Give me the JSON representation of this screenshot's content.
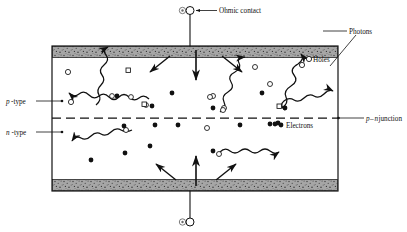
{
  "figure": {
    "labels": {
      "ohmic_contact": "Ohmic contact",
      "photons": "Photons",
      "holes": "Holes",
      "electrons": "Electrons",
      "p_type": "p-type",
      "n_type": "n-type",
      "pn_junction": "p–n junction"
    },
    "label_parts": {
      "p_italic": "p",
      "p_rest": "-type",
      "n_italic": "n",
      "n_rest": "-type",
      "junction_p": "p",
      "junction_dash": "–",
      "junction_n": "n",
      "junction_word": " junction"
    },
    "colors": {
      "ink": "#111111",
      "contact_band": "#9a9a9a",
      "contact_speckle": "#4a4a4a",
      "background": "#ffffff",
      "hole_outline": "#111111",
      "electron_fill": "#111111"
    },
    "geometry": {
      "device_x": 52,
      "device_y": 46,
      "device_w": 286,
      "device_h": 145,
      "band_h": 11,
      "junction_y": 118
    },
    "legend": {
      "hole_symbol": "open-circle",
      "electron_symbol": "filled-circle",
      "photon_symbol": "wavy-arrow",
      "current_symbol": "straight-arrow"
    },
    "carriers": {
      "holes": [
        [
          68,
          72
        ],
        [
          96,
          82
        ],
        [
          112,
          113
        ],
        [
          80,
          101
        ],
        [
          130,
          97
        ],
        [
          165,
          96
        ],
        [
          204,
          100
        ],
        [
          238,
          73
        ],
        [
          262,
          68
        ],
        [
          305,
          66
        ],
        [
          272,
          85
        ],
        [
          223,
          107
        ],
        [
          226,
          128
        ],
        [
          277,
          127
        ],
        [
          128,
          131
        ],
        [
          196,
          128
        ],
        [
          215,
          156
        ],
        [
          151,
          145
        ]
      ],
      "electrons": [
        [
          117,
          97
        ],
        [
          151,
          107
        ],
        [
          172,
          92
        ],
        [
          208,
          127
        ],
        [
          260,
          94
        ],
        [
          171,
          131
        ],
        [
          178,
          127
        ],
        [
          289,
          110
        ],
        [
          214,
          153
        ],
        [
          155,
          126
        ],
        [
          125,
          155
        ],
        [
          90,
          161
        ],
        [
          267,
          126
        ],
        [
          213,
          156
        ],
        [
          122,
          160
        ],
        [
          89,
          163
        ],
        [
          284,
          108
        ]
      ]
    },
    "photon_rays": [
      {
        "id": "photon-upper-left-exit",
        "from": [
          148,
          100
        ],
        "to": [
          38,
          84
        ],
        "dir": "left"
      },
      {
        "id": "photon-upper-mid-top",
        "from": [
          95,
          104
        ],
        "to": [
          124,
          42
        ],
        "dir": "up"
      },
      {
        "id": "photon-mid-top-right",
        "from": [
          220,
          112
        ],
        "to": [
          262,
          46
        ],
        "dir": "up"
      },
      {
        "id": "photon-top-right",
        "from": [
          285,
          112
        ],
        "to": [
          300,
          28
        ],
        "dir": "up"
      },
      {
        "id": "photon-right-exit",
        "from": [
          286,
          110
        ],
        "to": [
          352,
          71
        ],
        "dir": "right"
      },
      {
        "id": "photon-lower-left-exit",
        "from": [
          130,
          131
        ],
        "to": [
          48,
          152
        ],
        "dir": "left"
      },
      {
        "id": "photon-lower-right-exit",
        "from": [
          218,
          152
        ],
        "to": [
          293,
          157
        ],
        "dir": "right"
      }
    ],
    "current_arrows": [
      {
        "id": "current-top-center",
        "from": [
          196,
          50
        ],
        "to": [
          196,
          78
        ]
      },
      {
        "id": "current-top-left",
        "from": [
          168,
          58
        ],
        "to": [
          148,
          72
        ]
      },
      {
        "id": "current-top-right",
        "from": [
          224,
          58
        ],
        "to": [
          244,
          72
        ]
      },
      {
        "id": "current-bottom-center",
        "from": [
          196,
          188
        ],
        "to": [
          196,
          158
        ]
      },
      {
        "id": "current-bottom-left",
        "from": [
          175,
          180
        ],
        "to": [
          155,
          164
        ]
      },
      {
        "id": "current-bottom-right",
        "from": [
          218,
          180
        ],
        "to": [
          238,
          164
        ]
      }
    ],
    "terminals": {
      "top": {
        "x": 190,
        "y": 10,
        "lead_to_y": 46
      },
      "bottom": {
        "x": 190,
        "y": 222,
        "lead_from_y": 191
      }
    }
  }
}
